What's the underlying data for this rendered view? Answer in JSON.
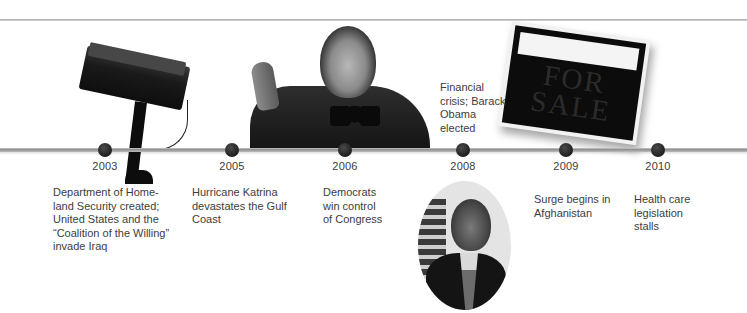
{
  "timeline": {
    "events": [
      {
        "year": "2003",
        "description": "Department of Home-\nland Security created;\nUnited States and the\n“Coalition of the Willing”\ninvade Iraq",
        "image": "security-camera"
      },
      {
        "year": "2005",
        "description": "Hurricane Katrina\ndevastates the Gulf\nCoast",
        "image": null
      },
      {
        "year": "2006",
        "description": "Democrats\nwin control\nof Congress",
        "image": "speaker-at-podium"
      },
      {
        "year": "2008",
        "description": "Financial\ncrisis; Barack\nObama\nelected",
        "image": "obama-oval-portrait"
      },
      {
        "year": "2009",
        "description": "Surge begins in\nAfghanistan",
        "image": null
      },
      {
        "year": "2010",
        "description": "Health care\nlegislation\nstalls",
        "image": null
      }
    ],
    "sign_text": "FOR\nSALE",
    "colors": {
      "dot": "#222222",
      "line": "#9a9a9a",
      "text": "#3d3d3d"
    }
  }
}
